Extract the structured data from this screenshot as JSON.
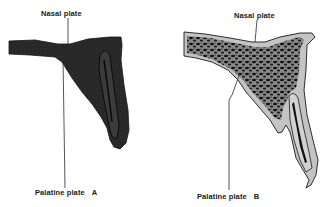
{
  "figure": {
    "panels": [
      {
        "id": "A",
        "letter": "A",
        "labels": {
          "nasal_plate": "Nasal plate",
          "palatine_plate": "Palatine plate"
        },
        "appearance": "dense dark section"
      },
      {
        "id": "B",
        "letter": "B",
        "labels": {
          "nasal_plate": "Nasal plate",
          "palatine_plate": "Palatine plate"
        },
        "appearance": "trabecular (spongy) section with light cortex"
      }
    ],
    "colors": {
      "background": "#ffffff",
      "bone_dark": "#1e1e1e",
      "bone_mid": "#3a3a3a",
      "cortex_light": "#bdbdbd",
      "label_text": "#1a1a1a",
      "leader_line": "#2a2a2a"
    }
  }
}
